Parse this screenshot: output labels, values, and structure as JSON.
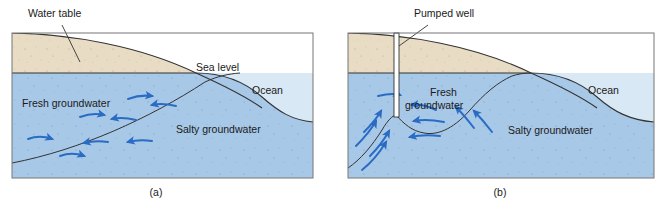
{
  "figure": {
    "background_color": "#ffffff"
  },
  "colors": {
    "land": "#e8dcc4",
    "fresh_groundwater": "#a8c8e8",
    "salty_groundwater": "#a8c8e8",
    "ocean_water": "#d8e8f4",
    "outline": "#333333",
    "arrow": "#2a6cc4",
    "text": "#1a1a1a",
    "frame": "#555555"
  },
  "panels": [
    {
      "id": "a",
      "caption": "(a)",
      "labels": [
        {
          "name": "water-table",
          "text": "Water table",
          "x": 28,
          "y": 17
        },
        {
          "name": "sea-level",
          "text": "Sea level",
          "x": 196,
          "y": 71
        },
        {
          "name": "ocean",
          "text": "Ocean",
          "x": 252,
          "y": 94
        },
        {
          "name": "fresh-groundwater",
          "text": "Fresh groundwater",
          "x": 22,
          "y": 107
        },
        {
          "name": "salty-groundwater",
          "text": "Salty groundwater",
          "x": 176,
          "y": 133
        }
      ],
      "flow_arrows": 8,
      "has_well": false
    },
    {
      "id": "b",
      "caption": "(b)",
      "labels": [
        {
          "name": "pumped-well",
          "text": "Pumped well",
          "x": 414,
          "y": 17
        },
        {
          "name": "ocean",
          "text": "Ocean",
          "x": 588,
          "y": 94
        },
        {
          "name": "fresh-groundwater-line1",
          "text": "Fresh",
          "x": 430,
          "y": 96
        },
        {
          "name": "fresh-groundwater-line2",
          "text": "groundwater",
          "x": 405,
          "y": 109
        },
        {
          "name": "salty-groundwater",
          "text": "Salty groundwater",
          "x": 508,
          "y": 134
        }
      ],
      "flow_arrows": 10,
      "has_well": true,
      "well_label": "Pumped well"
    }
  ]
}
